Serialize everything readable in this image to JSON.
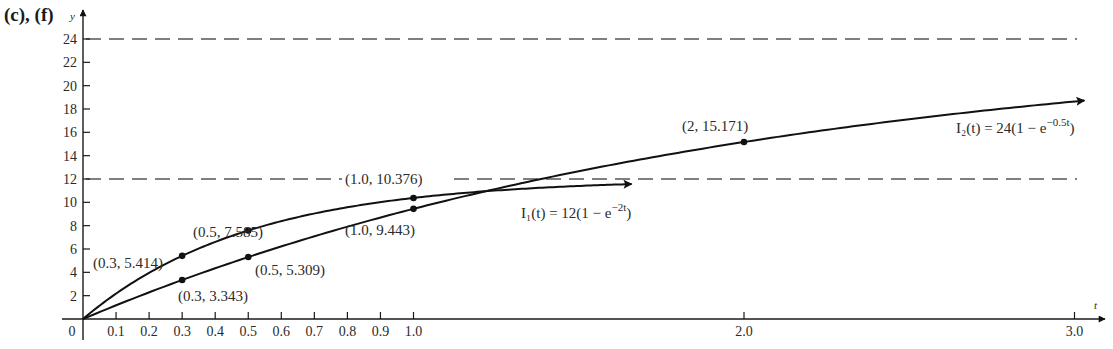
{
  "part_label": "(c), (f)",
  "chart_data": {
    "type": "line",
    "title": "",
    "xlabel": "t",
    "ylabel": "y",
    "xlim": [
      0,
      3.0
    ],
    "ylim": [
      0,
      24
    ],
    "grid": false,
    "x_ticks": [
      0.1,
      0.2,
      0.3,
      0.4,
      0.5,
      0.6,
      0.7,
      0.8,
      0.9,
      1.0,
      2.0,
      3.0
    ],
    "x_tick_labels": [
      "0.1",
      "0.2",
      "0.3",
      "0.4",
      "0.5",
      "0.6",
      "0.7",
      "0.8",
      "0.9",
      "1.0",
      "2.0",
      "3.0"
    ],
    "origin_label": "0",
    "y_ticks": [
      2,
      4,
      6,
      8,
      10,
      12,
      14,
      16,
      18,
      20,
      22,
      24
    ],
    "y_tick_labels": [
      "2",
      "4",
      "6",
      "8",
      "10",
      "12",
      "14",
      "16",
      "18",
      "20",
      "22",
      "24"
    ],
    "asymptotes": [
      {
        "y": 24,
        "style": "dashed"
      },
      {
        "y": 12,
        "style": "dashed"
      }
    ],
    "series": [
      {
        "name": "I1(t) = 12(1 - e^(-2t))",
        "formula": {
          "a": 12,
          "k": 2
        },
        "t_end": 1.66,
        "label": {
          "text": "I₁(t) = 12(1 − e",
          "sup": "−2t",
          "close": ")"
        },
        "points": [
          {
            "x": 0.3,
            "y": 5.414,
            "label": "(0.3, 5.414)"
          },
          {
            "x": 0.5,
            "y": 7.585,
            "label": "(0.5, 7.585)"
          },
          {
            "x": 1.0,
            "y": 10.376,
            "label": "(1.0, 10.376)"
          }
        ]
      },
      {
        "name": "I2(t) = 24(1 - e^(-0.5t))",
        "formula": {
          "a": 24,
          "k": 0.5
        },
        "t_end": 3.03,
        "label": {
          "text": "I₂(t) = 24(1 − e",
          "sup": "−0.5t",
          "close": ")"
        },
        "points": [
          {
            "x": 0.3,
            "y": 3.343,
            "label": "(0.3, 3.343)"
          },
          {
            "x": 0.5,
            "y": 5.309,
            "label": "(0.5, 5.309)"
          },
          {
            "x": 1.0,
            "y": 9.443,
            "label": "(1.0, 9.443)"
          },
          {
            "x": 2.0,
            "y": 15.171,
            "label": "(2, 15.171)"
          }
        ]
      }
    ],
    "colors": {
      "curve": "#111111",
      "axis": "#1a1a1a",
      "dashed": "#555555",
      "text": "#2a2a2a"
    }
  }
}
